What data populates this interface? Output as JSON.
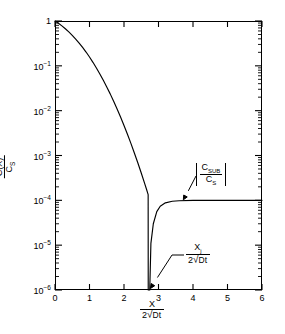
{
  "figure": {
    "kind": "semilog-diffusion-profile"
  },
  "axes": {
    "x": {
      "label_numerator": "X",
      "label_den_lead": "2",
      "label_den_radicand": "Dt",
      "ticks": [
        "0",
        "1",
        "2",
        "3",
        "4",
        "5",
        "6"
      ],
      "min": 0,
      "max": 6
    },
    "y": {
      "label_numerator": "C(X)",
      "label_den_main": "C",
      "label_den_sub": "S",
      "ticks": [
        {
          "mantissa": "1",
          "exponent": ""
        },
        {
          "mantissa": "10",
          "exponent": "-1"
        },
        {
          "mantissa": "10",
          "exponent": "-2"
        },
        {
          "mantissa": "10",
          "exponent": "-3"
        },
        {
          "mantissa": "10",
          "exponent": "-4"
        },
        {
          "mantissa": "10",
          "exponent": "-5"
        },
        {
          "mantissa": "10",
          "exponent": "-6"
        }
      ],
      "min_exp": -6,
      "max_exp": 0
    }
  },
  "annotations": {
    "substrate": {
      "numerator_main": "C",
      "numerator_sub": "SUB",
      "denominator_main": "C",
      "denominator_sub": "S",
      "absolute_value": true
    },
    "junction": {
      "numerator_main": "X",
      "numerator_sub": "j",
      "den_lead": "2",
      "den_radicand": "Dt"
    }
  },
  "chart_data": {
    "type": "line",
    "title": "",
    "xlabel": "X / (2√(Dt))",
    "ylabel": "C(X) / C_S",
    "xlim": [
      0,
      6
    ],
    "ylim_log10": [
      -6,
      0
    ],
    "yscale": "log",
    "grid": false,
    "legend": "none",
    "xticks": [
      0,
      1,
      2,
      3,
      4,
      5,
      6
    ],
    "yticks_log10": [
      0,
      -1,
      -2,
      -3,
      -4,
      -5,
      -6
    ],
    "minor_ticks": "log-decade minor ticks on both y-axes; inward ticks on all four sides",
    "junction_x": 2.72,
    "substrate_level": 0.0001,
    "series": [
      {
        "name": "|C(X)/Cs| erfc diffusion profile with substrate background",
        "description": "erfc(x) diffusion profile falling from 1, crossing the background level at the junction x_j where the net concentration passes through zero (dips to the bottom of the plot), then rising to the constant substrate plateau |C_SUB/C_S| = 1e-4.",
        "x": [
          0.0,
          0.1,
          0.2,
          0.3,
          0.4,
          0.5,
          0.6,
          0.7,
          0.8,
          0.9,
          1.0,
          1.1,
          1.2,
          1.3,
          1.4,
          1.5,
          1.6,
          1.7,
          1.8,
          1.9,
          2.0,
          2.1,
          2.2,
          2.3,
          2.4,
          2.5,
          2.6,
          2.65,
          2.7,
          2.72
        ],
        "y": [
          1.0,
          0.8875,
          0.7773,
          0.6714,
          0.5716,
          0.4795,
          0.3961,
          0.3222,
          0.2579,
          0.2031,
          0.1573,
          0.1198,
          0.0897,
          0.066,
          0.0477,
          0.0339,
          0.0237,
          0.0162,
          0.0109,
          0.00721,
          0.00468,
          0.00298,
          0.00186,
          0.00114,
          0.000689,
          0.000407,
          0.000236,
          0.000179,
          0.000134,
          1e-07
        ]
      },
      {
        "name": "substrate plateau",
        "x": [
          2.72,
          2.78,
          2.85,
          2.95,
          3.05,
          3.2,
          3.4,
          3.6,
          4.0,
          4.5,
          5.0,
          5.5,
          5.6
        ],
        "y": [
          1e-07,
          1.1e-05,
          3e-05,
          5.6e-05,
          7.4e-05,
          8.8e-05,
          9.55e-05,
          9.8e-05,
          9.95e-05,
          0.0001,
          0.0001,
          0.0001,
          0.0001
        ]
      }
    ]
  }
}
